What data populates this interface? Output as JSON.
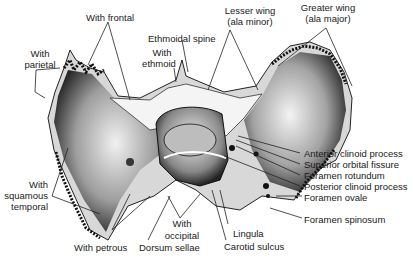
{
  "diagram": {
    "labels": {
      "with_frontal": "With frontal",
      "with_parietal_1": "With",
      "with_parietal_2": "parietal",
      "ethmoidal_spine": "Ethmoidal spine",
      "with_ethmoid_1": "With",
      "with_ethmoid_2": "ethmoid",
      "lesser_wing_1": "Lesser wing",
      "lesser_wing_2": "(ala minor)",
      "greater_wing_1": "Greater wing",
      "greater_wing_2": "(ala major)",
      "anterior_clinoid": "Anterior clinoid process",
      "superior_orbital": "Superior orbital fissure",
      "foramen_rotundum": "Foramen rotundum",
      "posterior_clinoid": "Posterior clinoid process",
      "foramen_ovale": "Foramen ovale",
      "foramen_spinosum": "Foramen spinosum",
      "with_squamous_1": "With",
      "with_squamous_2": "squamous",
      "with_squamous_3": "temporal",
      "with_petrous": "With petrous",
      "dorsum_sellae": "Dorsum sellae",
      "with_occipital_1": "With",
      "with_occipital_2": "occipital",
      "lingula": "Lingula",
      "carotid_sulcus": "Carotid sulcus"
    }
  }
}
